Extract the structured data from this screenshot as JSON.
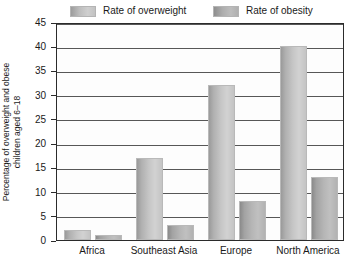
{
  "chart_data": {
    "type": "bar",
    "title": "",
    "xlabel": "",
    "ylabel_lines": [
      "Percentage of overweight and obese",
      "children aged 6–18"
    ],
    "ylabel": "Percentage of overweight and obese children aged 6–18",
    "categories": [
      "Africa",
      "Southeast Asia",
      "Europe",
      "North America"
    ],
    "series": [
      {
        "name": "Rate of overweight",
        "values": [
          2,
          17,
          32,
          40
        ],
        "color": "#c6c6c6"
      },
      {
        "name": "Rate of obesity",
        "values": [
          1,
          3,
          8,
          13
        ],
        "color": "#b0b0b0"
      }
    ],
    "ylim": [
      0,
      45
    ],
    "yticks": [
      0,
      5,
      10,
      15,
      20,
      25,
      30,
      35,
      40,
      45
    ],
    "ytick_labels": [
      "0",
      "5",
      "10",
      "15",
      "20",
      "25",
      "30",
      "35",
      "40",
      "45"
    ],
    "grid": true,
    "legend_position": "top"
  },
  "legend": {
    "entries": [
      {
        "label": "Rate of overweight",
        "swatch": "overweight-swatch"
      },
      {
        "label": "Rate of obesity",
        "swatch": "obesity-swatch"
      }
    ]
  }
}
